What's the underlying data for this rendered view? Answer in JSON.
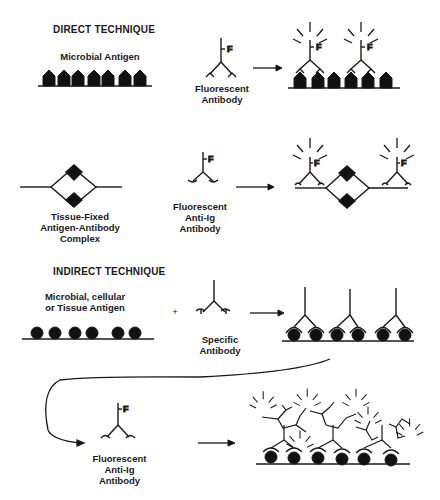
{
  "sections": {
    "direct": {
      "title": "DIRECT TECHNIQUE",
      "row1": {
        "antigen_label": "Microbial Antigen",
        "reagent_label_1": "Fluorescent",
        "reagent_label_2": "Antibody",
        "fluor_tag": "F"
      },
      "row2": {
        "complex_label_1": "Tissue-Fixed",
        "complex_label_2": "Antigen-Antibody",
        "complex_label_3": "Complex",
        "reagent_label_1": "Fluorescent",
        "reagent_label_2": "Anti-Ig",
        "reagent_label_3": "Antibody",
        "fluor_tag": "F"
      }
    },
    "indirect": {
      "title": "INDIRECT TECHNIQUE",
      "row1": {
        "antigen_label_1": "Microbial, cellular",
        "antigen_label_2": "or Tissue Antigen",
        "plus": "+",
        "reagent_label_1": "Specific",
        "reagent_label_2": "Antibody"
      },
      "row2": {
        "reagent_label_1": "Fluorescent",
        "reagent_label_2": "Anti-Ig",
        "reagent_label_3": "Antibody",
        "fluor_tag": "F"
      }
    }
  }
}
